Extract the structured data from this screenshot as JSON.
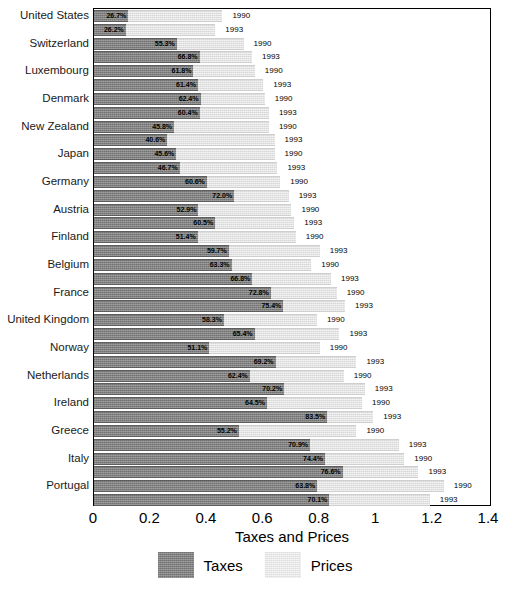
{
  "chart_data": {
    "type": "bar",
    "orientation": "horizontal",
    "stacked": true,
    "title": "",
    "xlabel": "Taxes and Prices",
    "ylabel": "",
    "xlim": [
      0,
      1.4
    ],
    "xticks": [
      "0",
      "0.2",
      "0.4",
      "0.6",
      "0.8",
      "1",
      "1.2",
      "1.4"
    ],
    "xtick_values": [
      0,
      0.2,
      0.4,
      0.6,
      0.8,
      1,
      1.2,
      1.4
    ],
    "grid": false,
    "legend": {
      "position": "bottom",
      "entries": [
        {
          "name": "Taxes",
          "color": "#828282"
        },
        {
          "name": "Prices",
          "color": "#e8e8e8"
        }
      ]
    },
    "series": [
      {
        "name": "Taxes",
        "color": "#828282"
      },
      {
        "name": "Prices",
        "color": "#e8e8e8"
      }
    ],
    "categories": [
      "United States",
      "Switzerland",
      "Luxembourg",
      "Denmark",
      "New Zealand",
      "Japan",
      "Germany",
      "Austria",
      "Finland",
      "Belgium",
      "France",
      "United Kingdom",
      "Norway",
      "Netherlands",
      "Ireland",
      "Greece",
      "Italy",
      "Portugal"
    ],
    "year_labels": [
      "1990",
      "1993"
    ],
    "rows": [
      {
        "country": "United States",
        "year": "1990",
        "tax_pct_label": "26.7%",
        "tax_share": 0.267,
        "total": 0.455
      },
      {
        "country": "United States",
        "year": "1993",
        "tax_pct_label": "26.2%",
        "tax_share": 0.262,
        "total": 0.43
      },
      {
        "country": "Switzerland",
        "year": "1990",
        "tax_pct_label": "55.3%",
        "tax_share": 0.553,
        "total": 0.53
      },
      {
        "country": "Switzerland",
        "year": "1993",
        "tax_pct_label": "66.8%",
        "tax_share": 0.668,
        "total": 0.56
      },
      {
        "country": "Luxembourg",
        "year": "1990",
        "tax_pct_label": "61.8%",
        "tax_share": 0.618,
        "total": 0.57
      },
      {
        "country": "Luxembourg",
        "year": "1993",
        "tax_pct_label": "61.4%",
        "tax_share": 0.614,
        "total": 0.6
      },
      {
        "country": "Denmark",
        "year": "1990",
        "tax_pct_label": "62.4%",
        "tax_share": 0.624,
        "total": 0.605
      },
      {
        "country": "Denmark",
        "year": "1993",
        "tax_pct_label": "60.4%",
        "tax_share": 0.604,
        "total": 0.62
      },
      {
        "country": "New Zealand",
        "year": "1990",
        "tax_pct_label": "45.8%",
        "tax_share": 0.458,
        "total": 0.62
      },
      {
        "country": "New Zealand",
        "year": "1993",
        "tax_pct_label": "40.6%",
        "tax_share": 0.406,
        "total": 0.64
      },
      {
        "country": "Japan",
        "year": "1990",
        "tax_pct_label": "45.6%",
        "tax_share": 0.456,
        "total": 0.64
      },
      {
        "country": "Japan",
        "year": "1993",
        "tax_pct_label": "46.7%",
        "tax_share": 0.467,
        "total": 0.65
      },
      {
        "country": "Germany",
        "year": "1990",
        "tax_pct_label": "60.6%",
        "tax_share": 0.606,
        "total": 0.66
      },
      {
        "country": "Germany",
        "year": "1993",
        "tax_pct_label": "72.0%",
        "tax_share": 0.72,
        "total": 0.69
      },
      {
        "country": "Austria",
        "year": "1990",
        "tax_pct_label": "52.9%",
        "tax_share": 0.529,
        "total": 0.7
      },
      {
        "country": "Austria",
        "year": "1993",
        "tax_pct_label": "60.5%",
        "tax_share": 0.605,
        "total": 0.71
      },
      {
        "country": "Finland",
        "year": "1990",
        "tax_pct_label": "51.4%",
        "tax_share": 0.514,
        "total": 0.715
      },
      {
        "country": "Finland",
        "year": "1993",
        "tax_pct_label": "59.7%",
        "tax_share": 0.597,
        "total": 0.8
      },
      {
        "country": "Belgium",
        "year": "1990",
        "tax_pct_label": "63.3%",
        "tax_share": 0.633,
        "total": 0.77
      },
      {
        "country": "Belgium",
        "year": "1993",
        "tax_pct_label": "66.8%",
        "tax_share": 0.668,
        "total": 0.84
      },
      {
        "country": "France",
        "year": "1990",
        "tax_pct_label": "72.8%",
        "tax_share": 0.728,
        "total": 0.86
      },
      {
        "country": "France",
        "year": "1993",
        "tax_pct_label": "75.4%",
        "tax_share": 0.754,
        "total": 0.89
      },
      {
        "country": "United Kingdom",
        "year": "1990",
        "tax_pct_label": "58.3%",
        "tax_share": 0.583,
        "total": 0.79
      },
      {
        "country": "United Kingdom",
        "year": "1993",
        "tax_pct_label": "65.4%",
        "tax_share": 0.654,
        "total": 0.87
      },
      {
        "country": "Norway",
        "year": "1990",
        "tax_pct_label": "51.1%",
        "tax_share": 0.511,
        "total": 0.8
      },
      {
        "country": "Norway",
        "year": "1993",
        "tax_pct_label": "69.2%",
        "tax_share": 0.692,
        "total": 0.93
      },
      {
        "country": "Netherlands",
        "year": "1990",
        "tax_pct_label": "62.4%",
        "tax_share": 0.624,
        "total": 0.885
      },
      {
        "country": "Netherlands",
        "year": "1993",
        "tax_pct_label": "70.2%",
        "tax_share": 0.702,
        "total": 0.96
      },
      {
        "country": "Ireland",
        "year": "1990",
        "tax_pct_label": "64.5%",
        "tax_share": 0.645,
        "total": 0.95
      },
      {
        "country": "Ireland",
        "year": "1993",
        "tax_pct_label": "83.5%",
        "tax_share": 0.835,
        "total": 0.99
      },
      {
        "country": "Greece",
        "year": "1990",
        "tax_pct_label": "55.2%",
        "tax_share": 0.552,
        "total": 0.93
      },
      {
        "country": "Greece",
        "year": "1993",
        "tax_pct_label": "70.9%",
        "tax_share": 0.709,
        "total": 1.08
      },
      {
        "country": "Italy",
        "year": "1990",
        "tax_pct_label": "74.4%",
        "tax_share": 0.744,
        "total": 1.1
      },
      {
        "country": "Italy",
        "year": "1993",
        "tax_pct_label": "76.6%",
        "tax_share": 0.766,
        "total": 1.15
      },
      {
        "country": "Portugal",
        "year": "1990",
        "tax_pct_label": "63.8%",
        "tax_share": 0.638,
        "total": 1.24
      },
      {
        "country": "Portugal",
        "year": "1993",
        "tax_pct_label": "70.1%",
        "tax_share": 0.701,
        "total": 1.19
      }
    ]
  },
  "axis": {
    "title": "Taxes and Prices",
    "ticks": [
      "0",
      "0.2",
      "0.4",
      "0.6",
      "0.8",
      "1",
      "1.2",
      "1.4"
    ]
  },
  "legend": {
    "taxes_label": "Taxes",
    "prices_label": "Prices"
  },
  "colors": {
    "taxes": "#828282",
    "prices": "#e8e8e8",
    "frame": "#000000"
  }
}
